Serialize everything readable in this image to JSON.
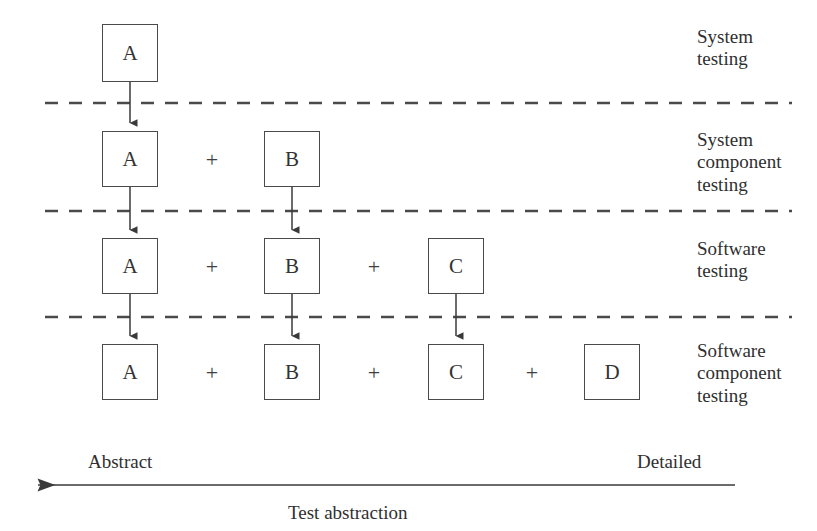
{
  "diagram": {
    "colors": {
      "box_border": "#4a4a4a",
      "text": "#2f2f2f",
      "connector": "#3a3a3a",
      "divider": "#4a4a4a",
      "background": "#ffffff"
    },
    "rows": [
      {
        "id": "row-system-testing",
        "label": "System\ntesting",
        "label_lines": [
          "System",
          "testing"
        ],
        "boxes": [
          {
            "id": "r1-a",
            "text": "A",
            "x": 102,
            "y": 24,
            "w": 56,
            "h": 58
          }
        ],
        "plus_signs": []
      },
      {
        "id": "row-system-component-testing",
        "label": "System\ncomponent\ntesting",
        "label_lines": [
          "System",
          "component",
          "testing"
        ],
        "boxes": [
          {
            "id": "r2-a",
            "text": "A",
            "x": 102,
            "y": 131,
            "w": 56,
            "h": 56
          },
          {
            "id": "r2-b",
            "text": "B",
            "x": 264,
            "y": 131,
            "w": 56,
            "h": 56
          }
        ],
        "plus_signs": [
          {
            "id": "r2-plus-1",
            "text": "+",
            "x": 200,
            "y": 149
          }
        ]
      },
      {
        "id": "row-software-testing",
        "label": "Software\ntesting",
        "label_lines": [
          "Software",
          "testing"
        ],
        "boxes": [
          {
            "id": "r3-a",
            "text": "A",
            "x": 102,
            "y": 238,
            "w": 56,
            "h": 56
          },
          {
            "id": "r3-b",
            "text": "B",
            "x": 264,
            "y": 238,
            "w": 56,
            "h": 56
          },
          {
            "id": "r3-c",
            "text": "C",
            "x": 428,
            "y": 238,
            "w": 56,
            "h": 56
          }
        ],
        "plus_signs": [
          {
            "id": "r3-plus-1",
            "text": "+",
            "x": 200,
            "y": 256
          },
          {
            "id": "r3-plus-2",
            "text": "+",
            "x": 362,
            "y": 256
          }
        ]
      },
      {
        "id": "row-software-component-testing",
        "label": "Software\ncomponent\ntesting",
        "label_lines": [
          "Software",
          "component",
          "testing"
        ],
        "boxes": [
          {
            "id": "r4-a",
            "text": "A",
            "x": 102,
            "y": 344,
            "w": 56,
            "h": 56
          },
          {
            "id": "r4-b",
            "text": "B",
            "x": 264,
            "y": 344,
            "w": 56,
            "h": 56
          },
          {
            "id": "r4-c",
            "text": "C",
            "x": 428,
            "y": 344,
            "w": 56,
            "h": 56
          },
          {
            "id": "r4-d",
            "text": "D",
            "x": 584,
            "y": 344,
            "w": 56,
            "h": 56
          }
        ],
        "plus_signs": [
          {
            "id": "r4-plus-1",
            "text": "+",
            "x": 200,
            "y": 362
          },
          {
            "id": "r4-plus-2",
            "text": "+",
            "x": 362,
            "y": 362
          },
          {
            "id": "r4-plus-3",
            "text": "+",
            "x": 520,
            "y": 362
          }
        ]
      }
    ],
    "tier_labels": [
      {
        "id": "label-system-testing",
        "text": "System\ntesting",
        "x": 697,
        "y": 26
      },
      {
        "id": "label-system-component-testing",
        "text": "System\ncomponent\ntesting",
        "x": 697,
        "y": 129
      },
      {
        "id": "label-software-testing",
        "text": "Software\ntesting",
        "x": 697,
        "y": 238
      },
      {
        "id": "label-software-component-testing",
        "text": "Software\ncomponent\ntesting",
        "x": 697,
        "y": 340
      }
    ],
    "dividers": [
      {
        "id": "divider-1",
        "y": 103,
        "x1": 45,
        "x2": 792
      },
      {
        "id": "divider-2",
        "y": 211,
        "x1": 45,
        "x2": 792
      },
      {
        "id": "divider-3",
        "y": 317,
        "x1": 45,
        "x2": 792
      }
    ],
    "connectors": [
      {
        "id": "connector-a-1-2",
        "x": 130,
        "y1": 82,
        "y2": 129
      },
      {
        "id": "connector-a-2-3",
        "x": 130,
        "y1": 187,
        "y2": 236
      },
      {
        "id": "connector-b-2-3",
        "x": 292,
        "y1": 187,
        "y2": 236
      },
      {
        "id": "connector-a-3-4",
        "x": 130,
        "y1": 294,
        "y2": 342
      },
      {
        "id": "connector-b-3-4",
        "x": 292,
        "y1": 294,
        "y2": 342
      },
      {
        "id": "connector-c-3-4",
        "x": 456,
        "y1": 294,
        "y2": 342
      }
    ],
    "axis": {
      "id": "test-abstraction-axis",
      "x_start": 735,
      "x_end": 20,
      "y": 485,
      "left_label": "Abstract",
      "right_label": "Detailed",
      "caption": "Test abstraction",
      "left_label_x": 88,
      "right_label_x": 637,
      "labels_y": 452,
      "caption_x": 288,
      "caption_y": 503
    }
  }
}
